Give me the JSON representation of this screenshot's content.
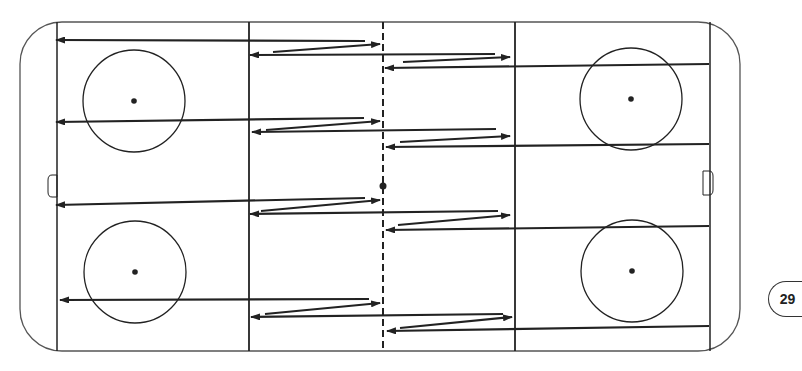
{
  "diagram": {
    "type": "hockey-rink-drill",
    "page_number": "29",
    "colors": {
      "line": "#222222",
      "board": "#555555",
      "background": "#ffffff"
    },
    "rink": {
      "x": 20,
      "y": 22,
      "width": 720,
      "height": 329,
      "corner_radius": 42,
      "left_goal_line_x": 57,
      "right_goal_line_x": 710,
      "left_blue_line_x": 249,
      "right_blue_line_x": 515,
      "center_line_x": 383,
      "center_dot": {
        "x": 383,
        "y": 186,
        "r": 3.5
      }
    },
    "faceoff_circles": [
      {
        "name": "top-left",
        "cx": 134,
        "cy": 101,
        "r": 51
      },
      {
        "name": "top-right",
        "cx": 631,
        "cy": 99,
        "r": 51
      },
      {
        "name": "bottom-left",
        "cx": 135,
        "cy": 272,
        "r": 51
      },
      {
        "name": "bottom-right",
        "cx": 632,
        "cy": 271,
        "r": 51
      }
    ],
    "goal_creases": [
      {
        "side": "left",
        "x": 57,
        "y1": 175,
        "y2": 197,
        "depth": 9
      },
      {
        "side": "right",
        "x": 703,
        "y1": 171,
        "y2": 195,
        "depth": 10
      }
    ],
    "lanes": [
      {
        "name": "lane-1",
        "paths": [
          {
            "from": [
              365,
              41
            ],
            "to": [
              56,
              40
            ],
            "arrow": "end"
          },
          {
            "from": [
              273,
              52
            ],
            "to": [
              380,
              44
            ],
            "arrow": "end"
          },
          {
            "from": [
              495,
              54
            ],
            "to": [
              250,
              55
            ],
            "arrow": "end"
          },
          {
            "from": [
              403,
              62
            ],
            "to": [
              510,
              57
            ],
            "arrow": "end"
          },
          {
            "from": [
              709,
              64
            ],
            "to": [
              385,
              68
            ],
            "arrow": "end"
          }
        ]
      },
      {
        "name": "lane-2",
        "paths": [
          {
            "from": [
              364,
              118
            ],
            "to": [
              56,
              122
            ],
            "arrow": "end"
          },
          {
            "from": [
              266,
              130
            ],
            "to": [
              380,
              121
            ],
            "arrow": "end"
          },
          {
            "from": [
              496,
              129
            ],
            "to": [
              252,
              132
            ],
            "arrow": "end"
          },
          {
            "from": [
              400,
              142
            ],
            "to": [
              510,
              136
            ],
            "arrow": "end"
          },
          {
            "from": [
              709,
              144
            ],
            "to": [
              386,
              147
            ],
            "arrow": "end"
          }
        ]
      },
      {
        "name": "lane-3",
        "paths": [
          {
            "from": [
              365,
              198
            ],
            "to": [
              56,
              205
            ],
            "arrow": "end"
          },
          {
            "from": [
              261,
              211
            ],
            "to": [
              380,
              200
            ],
            "arrow": "end"
          },
          {
            "from": [
              498,
              211
            ],
            "to": [
              250,
              214
            ],
            "arrow": "end"
          },
          {
            "from": [
              398,
              225
            ],
            "to": [
              510,
              215
            ],
            "arrow": "end"
          },
          {
            "from": [
              709,
              226
            ],
            "to": [
              386,
              230
            ],
            "arrow": "end"
          }
        ]
      },
      {
        "name": "lane-4",
        "paths": [
          {
            "from": [
              369,
              299
            ],
            "to": [
              60,
              300
            ],
            "arrow": "end"
          },
          {
            "from": [
              265,
              314
            ],
            "to": [
              380,
              303
            ],
            "arrow": "end"
          },
          {
            "from": [
              503,
              314
            ],
            "to": [
              251,
              317
            ],
            "arrow": "end"
          },
          {
            "from": [
              400,
              328
            ],
            "to": [
              512,
              317
            ],
            "arrow": "end"
          },
          {
            "from": [
              709,
              326
            ],
            "to": [
              387,
              331
            ],
            "arrow": "end"
          }
        ]
      }
    ]
  }
}
